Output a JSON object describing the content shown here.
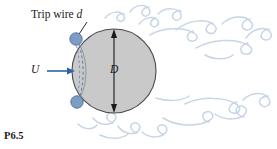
{
  "figure": {
    "number": "P6.5",
    "background_color": "#ffffff",
    "width": 277,
    "height": 149
  },
  "labels": {
    "trip_wire": "Trip wire",
    "trip_wire_symbol": "d",
    "velocity": "U",
    "diameter": "D"
  },
  "sphere": {
    "center_x": 114,
    "center_y": 71,
    "radius": 42,
    "fill_color": "#c9c9c9",
    "stroke_color": "#4a4a4a"
  },
  "trip_wires": [
    {
      "name": "upper-trip-wire",
      "cx": 76,
      "cy": 39,
      "r": 6.2
    },
    {
      "name": "lower-trip-wire",
      "cx": 77,
      "cy": 102,
      "r": 6.2
    }
  ],
  "colors": {
    "trip_wire_fill": "#7c9ec4",
    "trip_wire_stroke": "#4e7099",
    "flow_arrow": "#2f62a8",
    "wake_vortex": "#c8d5e6",
    "dashed_arc": "#5b7fa6",
    "dimension_line": "#262626",
    "leader_line": "#2b2b2b"
  },
  "flow_arrow": {
    "name": "freestream-arrow",
    "x1": 47,
    "y1": 71,
    "x2": 74,
    "y2": 71,
    "direction": "right"
  },
  "dimension": {
    "name": "diameter-dimension",
    "x": 114,
    "y_top": 30,
    "y_bottom": 112,
    "double_headed": true
  },
  "leader": {
    "name": "trip-wire-leader",
    "x1": 87,
    "y1": 23,
    "x2": 78,
    "y2": 35
  },
  "wake": {
    "description": "turbulent wake vortices",
    "count": 16
  }
}
